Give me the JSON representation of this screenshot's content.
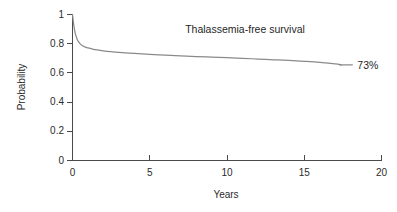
{
  "chart_data": {
    "type": "line",
    "title": "Thalassemia-free survival",
    "xlabel": "Years",
    "ylabel": "Probability",
    "xlim": [
      0,
      20
    ],
    "ylim": [
      0,
      1
    ],
    "grid": false,
    "legend": "none",
    "xticks": [
      "0",
      "5",
      "10",
      "15",
      "20"
    ],
    "xtick_values": [
      0,
      5,
      10,
      15,
      20
    ],
    "yticks": [
      "0",
      "0.2",
      "0.4",
      "0.6",
      "0.8",
      "1"
    ],
    "ytick_values": [
      0,
      0.2,
      0.4,
      0.6,
      0.8,
      1
    ],
    "line_color": "#8a8a8a",
    "axis_color": "#4a4a4a",
    "background_color": "#ffffff",
    "annotations": [
      {
        "text": "73%",
        "x": 18.6,
        "y": 0.65,
        "name": "endpoint-label"
      }
    ],
    "series": [
      {
        "name": "Thalassemia-free survival",
        "x": [
          0,
          0.05,
          0.1,
          0.15,
          0.2,
          0.3,
          0.4,
          0.5,
          0.6,
          0.8,
          1.0,
          1.3,
          1.6,
          2.0,
          2.5,
          3.0,
          4.0,
          5.0,
          6.0,
          7.0,
          8.0,
          9.0,
          10.0,
          11.0,
          12.0,
          13.0,
          14.0,
          15.0,
          16.0,
          17.0,
          17.4
        ],
        "values": [
          1.0,
          0.955,
          0.915,
          0.885,
          0.862,
          0.831,
          0.812,
          0.799,
          0.79,
          0.778,
          0.771,
          0.763,
          0.757,
          0.751,
          0.745,
          0.74,
          0.733,
          0.727,
          0.722,
          0.717,
          0.712,
          0.708,
          0.704,
          0.7,
          0.695,
          0.69,
          0.685,
          0.679,
          0.672,
          0.662,
          0.655
        ]
      }
    ]
  }
}
